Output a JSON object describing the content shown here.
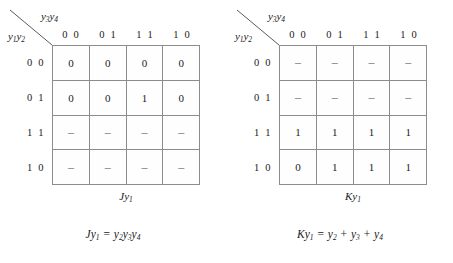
{
  "figure": {
    "type": "karnaugh-map-pair",
    "axis": {
      "column_variables": "y3y4",
      "row_variables": "y1y2",
      "column_headers": [
        "0 0",
        "0 1",
        "1 1",
        "1 0"
      ],
      "row_headers": [
        "0 0",
        "0 1",
        "1 1",
        "1 0"
      ]
    },
    "colors": {
      "background": "#ffffff",
      "grid_line": "#8c8c8c",
      "text": "#1a1a1a",
      "dash_text": "#6f6f6f"
    }
  },
  "maps": [
    {
      "id": "left",
      "caption_main": "J",
      "caption_var": "y",
      "caption_sub": "1",
      "cells": [
        [
          "0",
          "0",
          "0",
          "0"
        ],
        [
          "0",
          "0",
          "1",
          "0"
        ],
        [
          "–",
          "–",
          "–",
          "–"
        ],
        [
          "–",
          "–",
          "–",
          "–"
        ]
      ],
      "equation": {
        "lhs_fn": "J",
        "lhs_var": "y",
        "lhs_sub": "1",
        "equals": "=",
        "terms": [
          {
            "var": "y",
            "sub": "2",
            "op": ""
          },
          {
            "var": "y",
            "sub": "3",
            "op": ""
          },
          {
            "var": "y",
            "sub": "4",
            "op": ""
          }
        ],
        "text": "Jy1 = y2y3y4"
      }
    },
    {
      "id": "right",
      "caption_main": "K",
      "caption_var": "y",
      "caption_sub": "1",
      "cells": [
        [
          "–",
          "–",
          "–",
          "–"
        ],
        [
          "–",
          "–",
          "–",
          "–"
        ],
        [
          "1",
          "1",
          "1",
          "1"
        ],
        [
          "0",
          "1",
          "1",
          "1"
        ]
      ],
      "equation": {
        "lhs_fn": "K",
        "lhs_var": "y",
        "lhs_sub": "1",
        "equals": "=",
        "terms": [
          {
            "var": "y",
            "sub": "2",
            "op": ""
          },
          {
            "var": "y",
            "sub": "3",
            "op": "+"
          },
          {
            "var": "y",
            "sub": "4",
            "op": "+"
          }
        ],
        "text": "Ky1 = y2 + y3 + y4"
      }
    }
  ]
}
